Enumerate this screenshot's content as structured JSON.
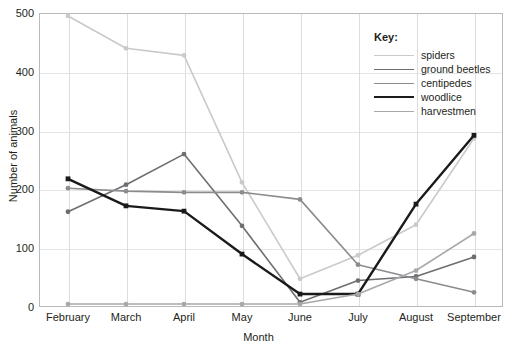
{
  "chart_data": {
    "type": "line",
    "title": "",
    "xlabel": "Month",
    "ylabel": "Number of animals",
    "categories": [
      "February",
      "March",
      "April",
      "May",
      "June",
      "July",
      "August",
      "September"
    ],
    "ylim": [
      0,
      500
    ],
    "yticks": [
      0,
      100,
      200,
      300,
      400,
      500
    ],
    "grid": true,
    "legend_position": "top-right",
    "legend_title": "Key:",
    "series": [
      {
        "name": "spiders",
        "color": "#c9cacb",
        "width": 1.6,
        "values": [
          495,
          440,
          428,
          212,
          48,
          88,
          140,
          287
        ]
      },
      {
        "name": "ground beetles",
        "color": "#6d6e71",
        "width": 1.6,
        "values": [
          162,
          208,
          260,
          138,
          8,
          45,
          52,
          85
        ]
      },
      {
        "name": "centipedes",
        "color": "#8b8c8e",
        "width": 1.6,
        "values": [
          202,
          197,
          195,
          195,
          183,
          72,
          48,
          25
        ]
      },
      {
        "name": "woodlice",
        "color": "#1a1a1a",
        "width": 2.4,
        "values": [
          218,
          172,
          163,
          90,
          22,
          22,
          175,
          292
        ]
      },
      {
        "name": "harvestmen",
        "color": "#a7a8aa",
        "width": 1.6,
        "values": [
          5,
          5,
          5,
          5,
          5,
          22,
          62,
          125
        ]
      }
    ]
  }
}
